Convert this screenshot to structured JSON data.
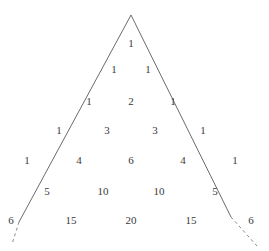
{
  "figure": {
    "name": "Pascal's Triangle",
    "background_color": "#ffffff",
    "text_color": "#3a3a3a",
    "line_color": "#6b6b6b"
  },
  "chart_data": {
    "type": "table",
    "subtitle": "",
    "xlabel": "",
    "ylabel": "",
    "grid": false,
    "legend": "none",
    "row_labels": [
      "0",
      "1",
      "2",
      "3",
      "4",
      "5",
      "6"
    ],
    "rows": [
      [
        1
      ],
      [
        1,
        1
      ],
      [
        1,
        2,
        1
      ],
      [
        1,
        3,
        3,
        1
      ],
      [
        1,
        4,
        6,
        4,
        1
      ],
      [
        1,
        5,
        10,
        10,
        5,
        1
      ],
      [
        1,
        6,
        15,
        20,
        15,
        6,
        1
      ]
    ],
    "row_sums": [
      1,
      2,
      4,
      8,
      16,
      32,
      64
    ],
    "n_rows": 7,
    "apex": {
      "x": 131,
      "y": 15
    },
    "row_y": [
      44,
      70,
      102,
      131,
      161,
      192,
      221
    ],
    "cell_pitch": [
      0,
      34,
      42,
      48,
      52,
      56,
      60
    ]
  },
  "outline": {
    "apex_x": 131,
    "apex_y": 15,
    "left_solid_end_x": 19,
    "left_solid_end_y": 222,
    "right_solid_end_x": 231,
    "right_solid_end_y": 217,
    "left_dash_end_x": 12,
    "left_dash_end_y": 244,
    "right_dash_end_x": 257,
    "right_dash_end_y": 246,
    "dash_pattern": "3 3",
    "stroke_width": 1
  }
}
